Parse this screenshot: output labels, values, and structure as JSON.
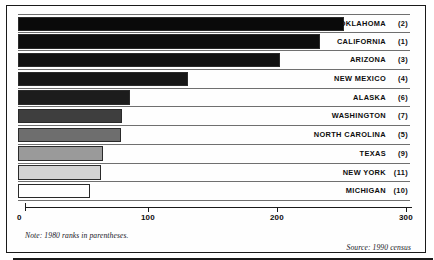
{
  "figure": {
    "note": "Note: 1980 ranks in parentheses.",
    "source": "Source: 1990 census"
  },
  "axis": {
    "ticks": [
      "0",
      "100",
      "200",
      "300"
    ]
  },
  "chart_data": {
    "type": "bar",
    "orientation": "horizontal",
    "title": "",
    "subtitle": "",
    "xlabel": "",
    "ylabel": "",
    "xlim": [
      0,
      300
    ],
    "grid": false,
    "legend": "none",
    "note": "Note: 1980 ranks in parentheses.",
    "source": "Source: 1990 census",
    "tick_values": [
      0,
      100,
      200,
      300
    ],
    "categories": [
      "OKLAHOMA",
      "CALIFORNIA",
      "ARIZONA",
      "NEW MEXICO",
      "ALASKA",
      "WASHINGTON",
      "NORTH CAROLINA",
      "TEXAS",
      "NEW YORK",
      "MICHIGAN"
    ],
    "values": [
      253,
      234,
      203,
      132,
      87,
      81,
      80,
      66,
      64,
      56
    ],
    "ranks_1980": [
      "(2)",
      "(1)",
      "(3)",
      "(4)",
      "(6)",
      "(7)",
      "(5)",
      "(9)",
      "(11)",
      "(10)"
    ],
    "bar_colors": [
      "#0a0a0a",
      "#0d0d0d",
      "#111111",
      "#161616",
      "#1c1c1c",
      "#3e3e3e",
      "#6e6e6e",
      "#9a9a9a",
      "#d2d2d2",
      "#ffffff"
    ],
    "rows": [
      {
        "name": "OKLAHOMA",
        "value": 253,
        "rank": "(2)",
        "color": "#0a0a0a"
      },
      {
        "name": "CALIFORNIA",
        "value": 234,
        "rank": "(1)",
        "color": "#0d0d0d"
      },
      {
        "name": "ARIZONA",
        "value": 203,
        "rank": "(3)",
        "color": "#111111"
      },
      {
        "name": "NEW MEXICO",
        "value": 132,
        "rank": "(4)",
        "color": "#161616"
      },
      {
        "name": "ALASKA",
        "value": 87,
        "rank": "(6)",
        "color": "#1c1c1c"
      },
      {
        "name": "WASHINGTON",
        "value": 81,
        "rank": "(7)",
        "color": "#3e3e3e"
      },
      {
        "name": "NORTH CAROLINA",
        "value": 80,
        "rank": "(5)",
        "color": "#6e6e6e"
      },
      {
        "name": "TEXAS",
        "value": 66,
        "rank": "(9)",
        "color": "#9a9a9a"
      },
      {
        "name": "NEW YORK",
        "value": 64,
        "rank": "(11)",
        "color": "#d2d2d2"
      },
      {
        "name": "MICHIGAN",
        "value": 56,
        "rank": "(10)",
        "color": "#ffffff"
      }
    ]
  }
}
